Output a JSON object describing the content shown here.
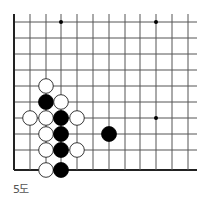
{
  "diagram": {
    "caption": "5도",
    "board": {
      "columns": 12,
      "rows": 10,
      "edges": [
        "left",
        "bottom"
      ],
      "star_points": [
        [
          3,
          0
        ],
        [
          9,
          0
        ],
        [
          9,
          6
        ]
      ],
      "stones": [
        {
          "color": "white",
          "col": 2,
          "row": 4
        },
        {
          "color": "black",
          "col": 2,
          "row": 5
        },
        {
          "color": "white",
          "col": 3,
          "row": 5
        },
        {
          "color": "white",
          "col": 1,
          "row": 6
        },
        {
          "color": "white",
          "col": 2,
          "row": 6
        },
        {
          "color": "black",
          "col": 3,
          "row": 6
        },
        {
          "color": "white",
          "col": 4,
          "row": 6
        },
        {
          "color": "white",
          "col": 2,
          "row": 7
        },
        {
          "color": "black",
          "col": 3,
          "row": 7
        },
        {
          "color": "black",
          "col": 6,
          "row": 7
        },
        {
          "color": "white",
          "col": 2,
          "row": 8
        },
        {
          "color": "black",
          "col": 3,
          "row": 8
        },
        {
          "color": "white",
          "col": 4,
          "row": 8
        },
        {
          "color": "white",
          "col": 2,
          "row": 9
        },
        {
          "color": "black",
          "col": 3,
          "row": 9
        }
      ]
    }
  }
}
